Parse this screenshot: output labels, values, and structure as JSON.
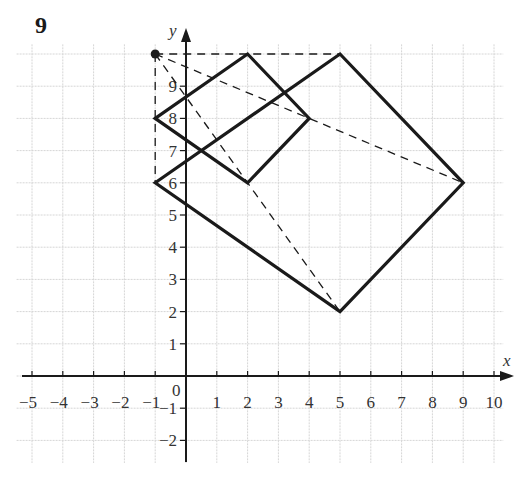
{
  "question_number": "9",
  "axes": {
    "x_label": "x",
    "y_label": "y",
    "origin_label": "0",
    "x_ticks": [
      "-5",
      "-4",
      "-3",
      "-2",
      "-1",
      "1",
      "2",
      "3",
      "4",
      "5",
      "6",
      "7",
      "8",
      "9",
      "10"
    ],
    "y_ticks": [
      "-2",
      "-1",
      "1",
      "2",
      "3",
      "4",
      "5",
      "6",
      "7",
      "8",
      "9"
    ],
    "xlim": [
      -5,
      10
    ],
    "ylim": [
      -2,
      10
    ],
    "grid": true
  },
  "center_point": {
    "label": "center of enlargement",
    "x": -1,
    "y": 10
  },
  "shapes": [
    {
      "name": "small-square",
      "vertices": [
        [
          -1,
          8
        ],
        [
          2,
          10
        ],
        [
          4,
          8
        ],
        [
          2,
          6
        ]
      ]
    },
    {
      "name": "large-square",
      "vertices": [
        [
          -1,
          6
        ],
        [
          5,
          10
        ],
        [
          9,
          6
        ],
        [
          5,
          2
        ]
      ]
    }
  ],
  "dashed_rays": [
    {
      "from": [
        -1,
        10
      ],
      "to": [
        5,
        10
      ]
    },
    {
      "from": [
        -1,
        10
      ],
      "to": [
        -1,
        6
      ]
    },
    {
      "from": [
        -1,
        10
      ],
      "to": [
        9,
        6
      ]
    },
    {
      "from": [
        -1,
        10
      ],
      "to": [
        5,
        2
      ]
    }
  ],
  "colors": {
    "ink": "#1a1a1a",
    "grid": "#d6d6d6"
  }
}
